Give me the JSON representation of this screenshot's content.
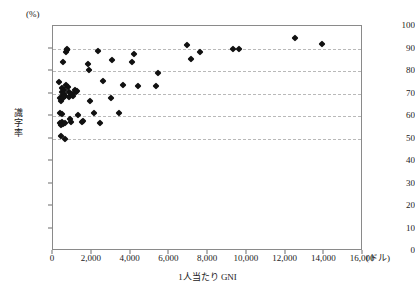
{
  "chart_data": {
    "type": "scatter",
    "title": "",
    "xlabel": "1人当たり GNI",
    "ylabel": "識字率",
    "x_unit": "(ドル)",
    "y_unit": "(%)",
    "xlim": [
      0,
      16000
    ],
    "ylim": [
      0,
      100
    ],
    "xticks": [
      0,
      2000,
      4000,
      6000,
      8000,
      10000,
      12000,
      14000,
      16000
    ],
    "xtick_labels": [
      "0",
      "2,000",
      "4,000",
      "6,000",
      "8,000",
      "10,000",
      "12,000",
      "14,000",
      "16,000"
    ],
    "yticks": [
      0,
      10,
      20,
      30,
      40,
      50,
      60,
      70,
      80,
      90,
      100
    ],
    "ytick_labels": [
      "0",
      "10",
      "20",
      "30",
      "40",
      "50",
      "60",
      "70",
      "80",
      "90",
      "100"
    ],
    "grid": true,
    "gridlines_y": [
      50,
      60,
      70,
      80,
      90
    ],
    "legend": null,
    "marker": "diamond",
    "marker_color": "#111111",
    "points": [
      [
        330,
        75.0
      ],
      [
        350,
        68.0
      ],
      [
        360,
        61.5
      ],
      [
        380,
        57.0
      ],
      [
        400,
        56.0
      ],
      [
        410,
        51.0
      ],
      [
        430,
        66.5
      ],
      [
        450,
        61.0
      ],
      [
        460,
        57.5
      ],
      [
        470,
        70.5
      ],
      [
        480,
        72.5
      ],
      [
        500,
        69.5
      ],
      [
        510,
        56.5
      ],
      [
        520,
        84.0
      ],
      [
        540,
        68.0
      ],
      [
        560,
        71.5
      ],
      [
        580,
        70.0
      ],
      [
        600,
        57.0
      ],
      [
        620,
        50.0
      ],
      [
        640,
        69.0
      ],
      [
        660,
        74.0
      ],
      [
        680,
        88.5
      ],
      [
        700,
        89.5
      ],
      [
        720,
        90.0
      ],
      [
        760,
        73.0
      ],
      [
        800,
        70.5
      ],
      [
        850,
        68.5
      ],
      [
        900,
        58.5
      ],
      [
        950,
        57.5
      ],
      [
        1000,
        70.0
      ],
      [
        1050,
        69.0
      ],
      [
        1150,
        71.5
      ],
      [
        1200,
        70.5
      ],
      [
        1250,
        71.0
      ],
      [
        1300,
        60.5
      ],
      [
        1500,
        57.5
      ],
      [
        1550,
        58.0
      ],
      [
        1800,
        83.0
      ],
      [
        1850,
        80.5
      ],
      [
        1900,
        66.5
      ],
      [
        2100,
        61.5
      ],
      [
        2300,
        89.0
      ],
      [
        2400,
        57.0
      ],
      [
        2600,
        75.5
      ],
      [
        3000,
        68.0
      ],
      [
        3050,
        85.0
      ],
      [
        3400,
        61.5
      ],
      [
        3600,
        74.0
      ],
      [
        4100,
        84.0
      ],
      [
        4200,
        87.5
      ],
      [
        4400,
        73.5
      ],
      [
        5300,
        73.5
      ],
      [
        5400,
        79.0
      ],
      [
        6900,
        91.5
      ],
      [
        7100,
        85.5
      ],
      [
        7600,
        88.5
      ],
      [
        9300,
        90.0
      ],
      [
        9600,
        90.0
      ],
      [
        12500,
        94.5
      ],
      [
        13900,
        92.0
      ]
    ]
  }
}
